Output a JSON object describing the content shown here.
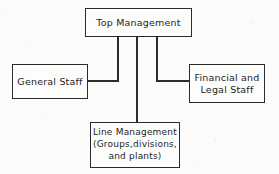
{
  "diagram": {
    "type": "organizational-chart",
    "orientation": "top-down",
    "background_color": "#fbfbfa",
    "line_color": "#2b2b2b",
    "box_fill_color": "#fdfdfc",
    "nodes": [
      {
        "id": "top-management",
        "lines": [
          "Top Management"
        ]
      },
      {
        "id": "general-staff",
        "lines": [
          "General Staff"
        ]
      },
      {
        "id": "financial-legal-staff",
        "lines": [
          "Financial and",
          "Legal Staff"
        ]
      },
      {
        "id": "line-management",
        "lines": [
          "Line Management",
          "(Groups,divisions,",
          "and plants)"
        ]
      }
    ],
    "connections": [
      {
        "from": "top-management",
        "to": "general-staff"
      },
      {
        "from": "top-management",
        "to": "line-management"
      },
      {
        "from": "top-management",
        "to": "financial-legal-staff"
      }
    ]
  }
}
